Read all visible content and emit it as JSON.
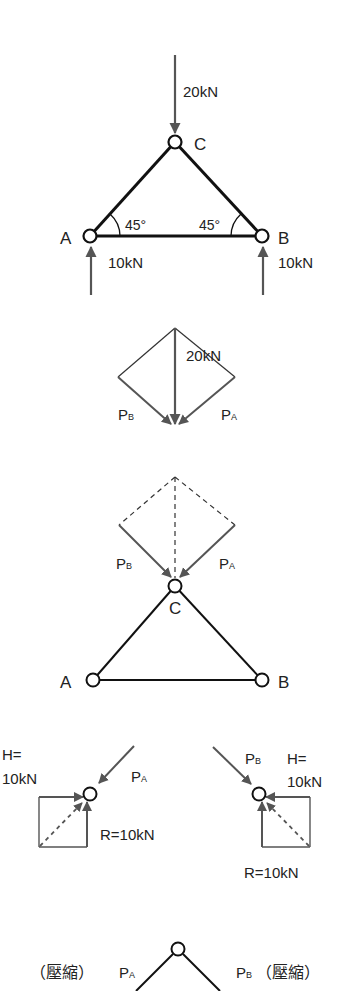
{
  "colors": {
    "member": "#111111",
    "force": "#555555",
    "background": "#ffffff"
  },
  "fig1": {
    "load_top": "20kN",
    "node_c": "C",
    "node_a": "A",
    "node_b": "B",
    "angle_left": "45°",
    "angle_right": "45°",
    "reaction_a": "10kN",
    "reaction_b": "10kN"
  },
  "fig2": {
    "load": "20kN",
    "pb_main": "P",
    "pb_sub": "B",
    "pa_main": "P",
    "pa_sub": "A"
  },
  "fig3": {
    "pb_main": "P",
    "pb_sub": "B",
    "pa_main": "P",
    "pa_sub": "A",
    "node_c": "C",
    "node_a": "A",
    "node_b": "B"
  },
  "fig4_left": {
    "h_line1": "H=",
    "h_line2": "10kN",
    "pa_main": "P",
    "pa_sub": "A",
    "r_label": "R=10kN"
  },
  "fig4_right": {
    "pb_main": "P",
    "pb_sub": "B",
    "h_line1": "H=",
    "h_line2": "10kN",
    "r_label": "R=10kN"
  },
  "fig5": {
    "left_note": "（壓縮）",
    "pa_main": "P",
    "pa_sub": "A",
    "pb_main": "P",
    "pb_sub": "B",
    "right_note": "（壓縮）"
  }
}
